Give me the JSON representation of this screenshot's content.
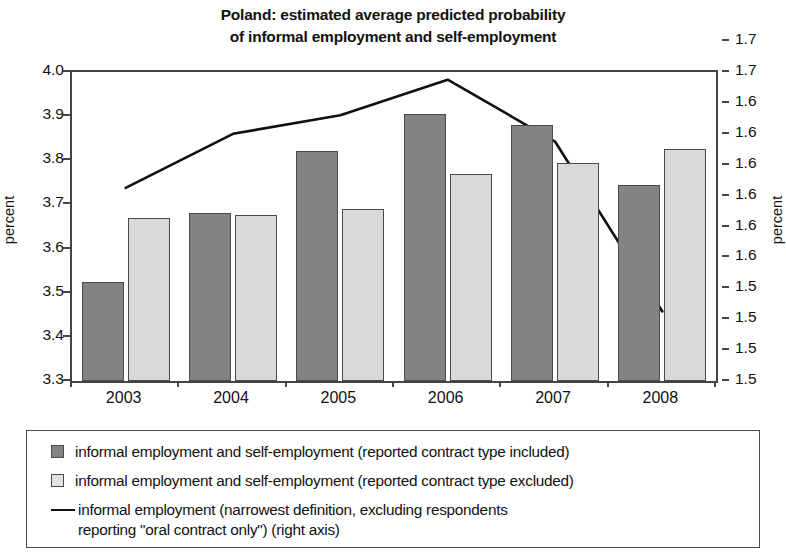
{
  "chart_data": {
    "type": "bar",
    "title": "Poland: estimated average predicted probability of informal employment and self-employment",
    "title_line1": "Poland: estimated average predicted probability",
    "title_line2": "of informal employment and self-employment",
    "xlabel": "",
    "ylabel": "percent",
    "y2label": "percent",
    "categories": [
      "2003",
      "2004",
      "2005",
      "2006",
      "2007",
      "2008"
    ],
    "ylim": [
      3.3,
      4.0
    ],
    "yticks": [
      "3.3",
      "3.4",
      "3.5",
      "3.6",
      "3.7",
      "3.8",
      "3.9",
      "4.0"
    ],
    "ytick_values": [
      3.3,
      3.4,
      3.5,
      3.6,
      3.7,
      3.8,
      3.9,
      4.0
    ],
    "y2lim": [
      1.5,
      1.7
    ],
    "y2ticks": [
      "1.5",
      "1.5",
      "1.5",
      "1.5",
      "1.6",
      "1.6",
      "1.6",
      "1.6",
      "1.6",
      "1.6",
      "1.7",
      "1.7"
    ],
    "y2tick_values": [
      1.5,
      1.52,
      1.54,
      1.56,
      1.58,
      1.6,
      1.62,
      1.64,
      1.66,
      1.68,
      1.7,
      1.72
    ],
    "grid": false,
    "legend_position": "bottom",
    "series": [
      {
        "name": "informal employment and self-employment (reported contract type included)",
        "kind": "bar",
        "color": "#838383",
        "axis": "left",
        "values": [
          3.525,
          3.68,
          3.82,
          3.905,
          3.88,
          3.745
        ]
      },
      {
        "name": "informal employment and self-employment (reported contract type excluded)",
        "kind": "bar",
        "color": "#d9d9d9",
        "axis": "left",
        "values": [
          3.67,
          3.675,
          3.69,
          3.77,
          3.795,
          3.825
        ]
      },
      {
        "name": "informal employment (narrowest definition, excluding respondents reporting \"oral contract only\") (right axis)",
        "kind": "line",
        "color": "#111111",
        "axis": "right",
        "values": [
          1.625,
          1.66,
          1.672,
          1.695,
          1.655,
          1.545
        ]
      }
    ]
  },
  "legend": {
    "items": [
      {
        "marker": "dark-square",
        "label": "informal employment and self-employment (reported contract type included)"
      },
      {
        "marker": "light-square",
        "label": "informal employment and self-employment (reported contract type excluded)"
      },
      {
        "marker": "line",
        "label_line1": "informal employment (narrowest definition, excluding respondents",
        "label_line2": "reporting \"oral contract only\") (right axis)"
      }
    ]
  },
  "colors": {
    "dark_bar": "#838383",
    "light_bar": "#d9d9d9",
    "line": "#111111",
    "axis": "#444444"
  }
}
